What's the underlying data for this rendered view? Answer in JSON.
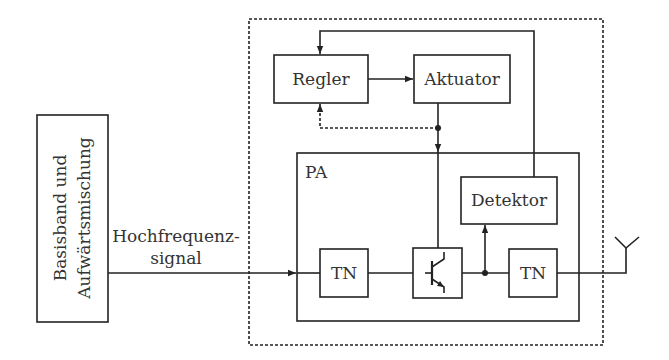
{
  "diagram": {
    "type": "block-diagram",
    "blocks": {
      "baseband": {
        "line1": "Basisband und",
        "line2": "Aufwärtsmischung"
      },
      "regler": {
        "label": "Regler"
      },
      "aktuator": {
        "label": "Aktuator"
      },
      "pa": {
        "label": "PA"
      },
      "detektor": {
        "label": "Detektor"
      },
      "tn_input": {
        "label": "TN"
      },
      "tn_output": {
        "label": "TN"
      },
      "transistor": {
        "label": ""
      }
    },
    "signal_label": {
      "line1": "Hochfrequenz-",
      "line2": "signal"
    },
    "colors": {
      "stroke": "#222222",
      "text": "#333333",
      "background": "#ffffff"
    }
  }
}
